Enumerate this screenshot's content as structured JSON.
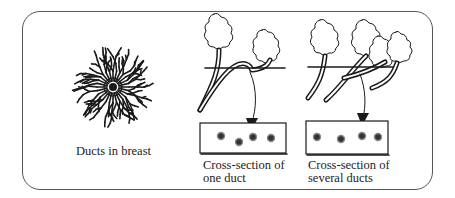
{
  "figure": {
    "panels": [
      {
        "id": "ducts-in-breast",
        "caption": "Ducts in breast"
      },
      {
        "id": "one-duct",
        "caption_line1": "Cross-section of",
        "caption_line2": "one duct"
      },
      {
        "id": "several-ducts",
        "caption_line1": "Cross-section of",
        "caption_line2": "several ducts"
      }
    ],
    "colors": {
      "ink": "#1a1a1a",
      "frame": "#555555",
      "background": "#ffffff"
    }
  }
}
